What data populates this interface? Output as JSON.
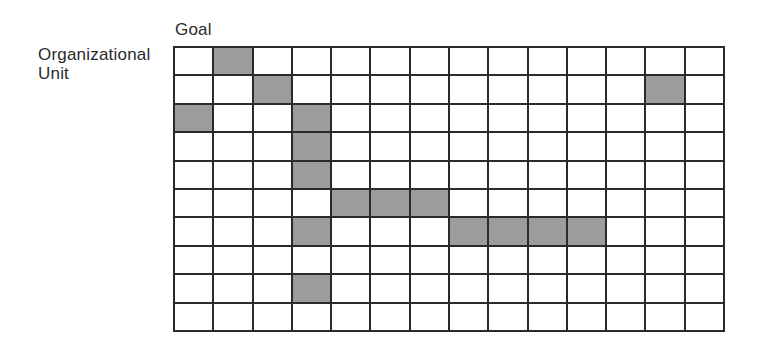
{
  "labels": {
    "column_axis": "Goal",
    "row_axis_line1": "Organizational",
    "row_axis_line2": "Unit"
  },
  "grid": {
    "rows": 10,
    "columns": 14,
    "fill_color": "#9c9c9c",
    "line_color": "#2a2a2a",
    "shaded_cells": [
      [
        0,
        1
      ],
      [
        1,
        2
      ],
      [
        1,
        12
      ],
      [
        2,
        0
      ],
      [
        2,
        3
      ],
      [
        3,
        3
      ],
      [
        4,
        3
      ],
      [
        5,
        4
      ],
      [
        5,
        5
      ],
      [
        5,
        6
      ],
      [
        6,
        3
      ],
      [
        6,
        7
      ],
      [
        6,
        8
      ],
      [
        6,
        9
      ],
      [
        6,
        10
      ],
      [
        8,
        3
      ]
    ]
  }
}
